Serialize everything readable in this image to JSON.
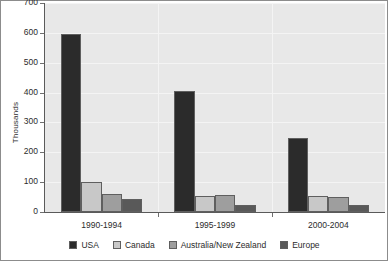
{
  "chart_data": {
    "type": "bar",
    "title": "",
    "subtitle": "",
    "xlabel": "",
    "ylabel": "Thousands",
    "categories": [
      "1990-1994",
      "1995-1999",
      "2000-2004"
    ],
    "series": [
      {
        "name": "USA",
        "color": "#2b2b2b",
        "values": [
          595,
          405,
          247
        ]
      },
      {
        "name": "Canada",
        "color": "#c8c8c8",
        "values": [
          101,
          55,
          53
        ]
      },
      {
        "name": "Australia/New Zealand",
        "color": "#9e9e9e",
        "values": [
          59,
          58,
          50
        ]
      },
      {
        "name": "Europe",
        "color": "#595959",
        "values": [
          42,
          25,
          25
        ]
      }
    ],
    "ylim": [
      0,
      700
    ],
    "ytick_values": [
      0,
      100,
      200,
      300,
      400,
      500,
      600,
      700
    ],
    "ytick_labels": [
      "0",
      "100",
      "200",
      "300",
      "400",
      "500",
      "600",
      "700"
    ],
    "grid": {
      "horizontal": true,
      "vertical": true
    },
    "legend": {
      "position": "bottom",
      "orientation": "horizontal"
    },
    "plot_background": "#e8e8e8",
    "gridline_color": "#f4f4f4",
    "axis_color": "#5a5a5a",
    "text_color": "#2b2b2b"
  }
}
